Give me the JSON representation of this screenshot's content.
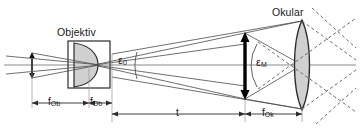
{
  "figure": {
    "type": "optical-ray-diagram",
    "background_color": "#ffffff",
    "line_color": "#3c3c3c",
    "axis_color": "#808080",
    "lens_fill": "#d4d4d4",
    "arrow_color": "#000000"
  },
  "labels": {
    "objective_title": "Objektiv",
    "eyepiece_title": "Okular",
    "angle_object": "ε",
    "angle_object_sub": "0",
    "angle_image": "ε",
    "angle_image_sub": "M",
    "focal_objective_left": "f",
    "focal_objective_left_sub": "Ob",
    "focal_objective_right": "f",
    "focal_objective_right_sub": "Ob",
    "tube_length": "t",
    "focal_eyepiece": "f",
    "focal_eyepiece_sub": "Ok"
  },
  "geometry": {
    "optical_axis_y": 65,
    "objective_box": {
      "x": 68,
      "y": 41,
      "width": 42,
      "height": 47
    },
    "objective_lens_center_x": 89,
    "eyepiece_center_x": 302,
    "eyepiece_top_y": 20,
    "eyepiece_bottom_y": 110,
    "intermediate_image_x": 245,
    "intermediate_image_top_y": 33,
    "intermediate_image_bottom_y": 99,
    "object_arrow_x": 32,
    "dimension_row_fob_y": 103,
    "dimension_row_t_y": 113
  }
}
